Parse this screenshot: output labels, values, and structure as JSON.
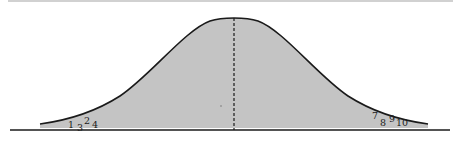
{
  "diagram": {
    "type": "normal-distribution-curve",
    "colors": {
      "fill": "#c4c4c4",
      "curve": "#1a1a1a",
      "baseline": "#1a1a1a",
      "mean_line": "#1a1a1a",
      "background": "#ffffff"
    },
    "mean_line_style": "dashed",
    "left_tail_labels": [
      {
        "text": "1",
        "x": 68,
        "y": 128
      },
      {
        "text": "3",
        "x": 77,
        "y": 131
      },
      {
        "text": "2",
        "x": 84,
        "y": 124
      },
      {
        "text": "4",
        "x": 92,
        "y": 128
      }
    ],
    "right_tail_labels": [
      {
        "text": "7",
        "x": 372,
        "y": 119
      },
      {
        "text": "8",
        "x": 380,
        "y": 126
      },
      {
        "text": "9",
        "x": 389,
        "y": 122
      },
      {
        "text": "10",
        "x": 396,
        "y": 126
      }
    ]
  }
}
